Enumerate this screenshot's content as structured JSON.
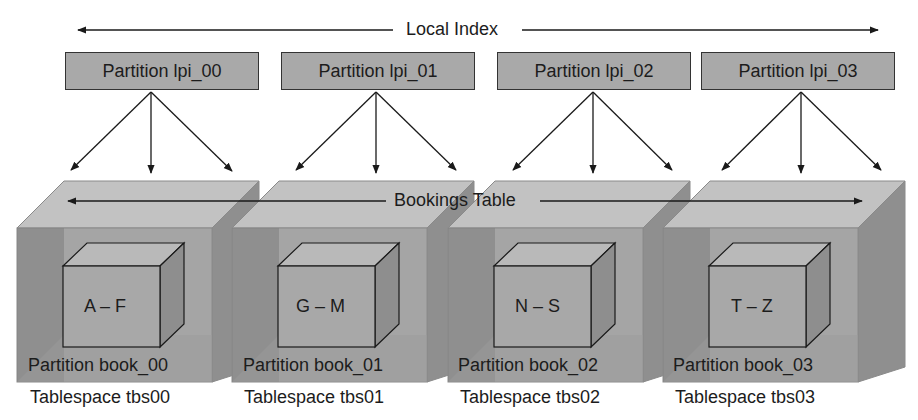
{
  "diagram": {
    "top_label": "Local Index",
    "middle_label": "Bookings Table",
    "index_partitions": [
      {
        "label": "Partition lpi_00"
      },
      {
        "label": "Partition lpi_01"
      },
      {
        "label": "Partition lpi_02"
      },
      {
        "label": "Partition lpi_03"
      }
    ],
    "tablespaces": [
      {
        "range": "A – F",
        "partition": "Partition book_00",
        "tablespace": "Tablespace tbs00"
      },
      {
        "range": "G – M",
        "partition": "Partition book_01",
        "tablespace": "Tablespace tbs01"
      },
      {
        "range": "N – S",
        "partition": "Partition book_02",
        "tablespace": "Tablespace tbs02"
      },
      {
        "range": "T – Z",
        "partition": "Partition book_03",
        "tablespace": "Tablespace tbs03"
      }
    ],
    "colors": {
      "partition_box": "#a9a9a9",
      "cube_front": "#a6a6a6",
      "cube_top": "#c4c4c4",
      "cube_side": "#8e8e8e",
      "cube_left_shadow": "#7f7f7f",
      "line": "#1a1a1a"
    }
  }
}
